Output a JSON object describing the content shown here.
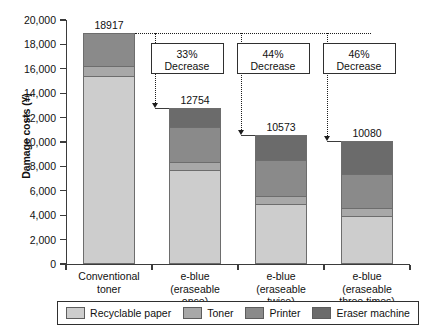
{
  "chart_data": {
    "type": "bar",
    "subtype": "stacked-bar",
    "title": "",
    "xlabel": "",
    "ylabel": "Damage costs (¥)",
    "ylim": [
      0,
      20000
    ],
    "ytick_labels": [
      "20,000",
      "18,000",
      "16,000",
      "14,000",
      "12,000",
      "10,000",
      "8,000",
      "6,000",
      "4,000",
      "2,000",
      "0"
    ],
    "ytick_values": [
      20000,
      18000,
      16000,
      14000,
      12000,
      10000,
      8000,
      6000,
      4000,
      2000,
      0
    ],
    "grid": false,
    "legend_position": "bottom",
    "categories": [
      "Conventional toner",
      "e-blue (eraseable once)",
      "e-blue (eraseable twice)",
      "e-blue (eraseable three times)"
    ],
    "category_lines": [
      [
        "Conventional",
        "toner"
      ],
      [
        "e-blue",
        "(eraseable",
        "once)"
      ],
      [
        "e-blue",
        "(eraseable",
        "twice)"
      ],
      [
        "e-blue",
        "(eraseable",
        "three times)"
      ]
    ],
    "series": [
      {
        "name": "Recyclable paper",
        "color": "#cdcdcd",
        "values": [
          15400,
          7700,
          4900,
          3900
        ]
      },
      {
        "name": "Toner",
        "color": "#a8a8a8",
        "values": [
          800,
          700,
          700,
          700
        ]
      },
      {
        "name": "Printer",
        "color": "#8a8a8a",
        "values": [
          2717,
          2800,
          2900,
          2800
        ]
      },
      {
        "name": "Eraser machine",
        "color": "#6b6b6b",
        "values": [
          0,
          1554,
          2073,
          2680
        ]
      }
    ],
    "totals": [
      18917,
      12754,
      10573,
      10080
    ],
    "total_labels": [
      "18917",
      "12754",
      "10573",
      "10080"
    ],
    "annotations": [
      {
        "label_top": "33%",
        "label_bottom": "Decrease",
        "from_category": 0,
        "to_category": 1
      },
      {
        "label_top": "44%",
        "label_bottom": "Decrease",
        "from_category": 0,
        "to_category": 2
      },
      {
        "label_top": "46%",
        "label_bottom": "Decrease",
        "from_category": 0,
        "to_category": 3
      }
    ]
  },
  "legend": {
    "entries": [
      {
        "label": "Recyclable paper",
        "color": "#cdcdcd"
      },
      {
        "label": "Toner",
        "color": "#a8a8a8"
      },
      {
        "label": "Printer",
        "color": "#8a8a8a"
      },
      {
        "label": "Eraser machine",
        "color": "#6b6b6b"
      }
    ]
  },
  "axis": {
    "y_title": "Damage costs (¥)"
  }
}
